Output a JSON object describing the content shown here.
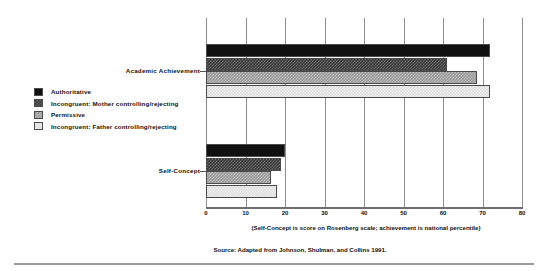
{
  "chart_data": {
    "type": "bar",
    "orientation": "horizontal",
    "title": "",
    "xlabel": "(Self-Concept is score on Rosenberg scale;  achievement is national percentile)",
    "ylabel": "",
    "xlim": [
      0,
      80
    ],
    "xticks": [
      "0",
      "10",
      "20",
      "30",
      "40",
      "50",
      "60",
      "70",
      "80"
    ],
    "grid": true,
    "legend_position": "left",
    "categories": [
      "Academic Achievement",
      "Self-Concept"
    ],
    "series": [
      {
        "name": "Authoritative",
        "swatch": "fill-black",
        "values": [
          72,
          20
        ]
      },
      {
        "name": "Incongruent: Mother controlling/rejecting",
        "swatch": "fill-darkcheck",
        "values": [
          61,
          19
        ]
      },
      {
        "name": "Permissive",
        "swatch": "fill-midgray",
        "values": [
          68.5,
          16.5
        ]
      },
      {
        "name": "Incongruent: Father controlling/rejecting",
        "swatch": "fill-lightgray",
        "values": [
          72,
          18
        ]
      }
    ],
    "source": "Source: Adapted from Johnson, Shulman, and Collins 1991."
  },
  "legend": {
    "items": [
      {
        "label": "Authoritative"
      },
      {
        "label": "Incongruent: Mother controlling/rejecting"
      },
      {
        "label": "Permissive"
      },
      {
        "label": "Incongruent: Father controlling/rejecting"
      }
    ]
  },
  "axis": {
    "ticks": [
      "0",
      "10",
      "20",
      "30",
      "40",
      "50",
      "60",
      "70",
      "80"
    ]
  },
  "categories": [
    {
      "label": "Academic Achievement"
    },
    {
      "label": "Self-Concept"
    }
  ],
  "notes": {
    "axis_note": "(Self-Concept is score on Rosenberg scale;  achievement is national percentile)",
    "source": "Source: Adapted from Johnson, Shulman, and Collins 1991."
  }
}
